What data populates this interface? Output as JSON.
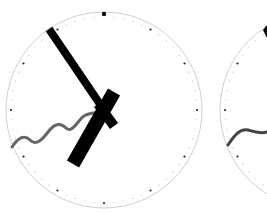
{
  "scene": {
    "background": "#ffffff",
    "clocks": [
      {
        "id": "clock-1",
        "center": [
          104,
          110
        ],
        "radius": 98,
        "rim_color": "#cfcfcf",
        "minute_hand": {
          "angle_deg": 325,
          "length": 92,
          "width": 8,
          "tail": 0,
          "color": "#000000"
        },
        "hour_hand": {
          "angle_deg": 210,
          "length": 62,
          "width": 14,
          "tail": 22,
          "color": "#000000"
        },
        "pendulum_wave": {
          "color": "#666666",
          "width": 3
        }
      },
      {
        "id": "clock-2",
        "center": [
          318,
          110
        ],
        "radius": 98,
        "rim_color": "#cfcfcf",
        "minute_hand": {
          "angle_deg": 325,
          "length": 92,
          "width": 8,
          "tail": 0,
          "color": "#000000"
        },
        "pendulum_wave": {
          "color": "#444444",
          "width": 3
        }
      }
    ],
    "twelve_marker_color": "#000000",
    "tick_color": "#aaaaaa"
  }
}
